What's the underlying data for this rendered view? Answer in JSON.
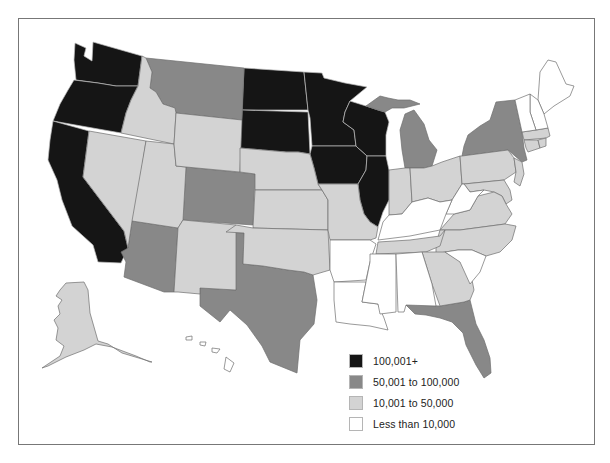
{
  "map": {
    "title": "",
    "colors": {
      "tier_1": "#151515",
      "tier_2": "#888888",
      "tier_3": "#d3d3d3",
      "tier_4": "#ffffff",
      "border": "#6e6e6e"
    },
    "states": {
      "tier_1": [
        "Washington",
        "Oregon",
        "California",
        "North Dakota",
        "South Dakota",
        "Minnesota",
        "Wisconsin",
        "Iowa",
        "Illinois"
      ],
      "tier_2": [
        "Montana",
        "Colorado",
        "Arizona",
        "Texas",
        "Michigan",
        "New York",
        "Florida"
      ],
      "tier_3": [
        "Idaho",
        "Nevada",
        "Utah",
        "Wyoming",
        "New Mexico",
        "Nebraska",
        "Kansas",
        "Oklahoma",
        "Missouri",
        "Indiana",
        "Ohio",
        "Pennsylvania",
        "New Jersey",
        "Maryland",
        "Delaware",
        "Virginia",
        "North Carolina",
        "Tennessee",
        "Georgia",
        "Massachusetts",
        "Connecticut",
        "Rhode Island",
        "Alaska"
      ],
      "tier_4": [
        "Maine",
        "New Hampshire",
        "Vermont",
        "West Virginia",
        "Kentucky",
        "Arkansas",
        "Louisiana",
        "Mississippi",
        "Alabama",
        "South Carolina",
        "Hawaii"
      ]
    }
  },
  "legend": {
    "items": [
      {
        "label": "100,001+",
        "color": "#151515"
      },
      {
        "label": "50,001 to 100,000",
        "color": "#888888"
      },
      {
        "label": "10,001 to 50,000",
        "color": "#d3d3d3"
      },
      {
        "label": "Less than 10,000",
        "color": "#ffffff"
      }
    ]
  }
}
